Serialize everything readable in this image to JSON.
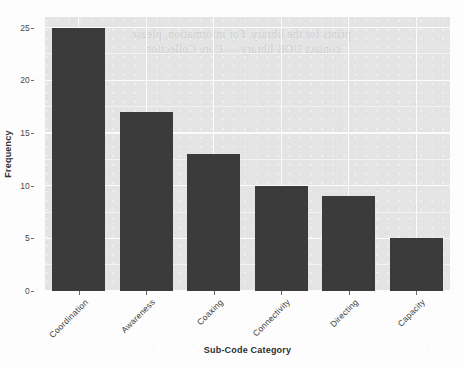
{
  "chart_data": {
    "type": "bar",
    "title": "",
    "xlabel": "Sub-Code Category",
    "ylabel": "Frequency",
    "categories": [
      "Coordination",
      "Awareness",
      "Coaxing",
      "Connectivity",
      "Directing",
      "Capacity"
    ],
    "values": [
      25,
      17,
      13,
      10,
      9,
      5
    ],
    "ylim": [
      0,
      26
    ],
    "yticks": [
      "0",
      "5",
      "10",
      "15",
      "20",
      "25"
    ],
    "ytick_values": [
      0,
      5,
      10,
      15,
      20,
      25
    ],
    "grid": "horizontal-and-vertical-white-on-gray-panel",
    "legend": "none",
    "bar_color": "#3b3b3b",
    "panel_color": "#e4e4e4",
    "gridline_color": "#fbfbfb"
  },
  "scan_artifacts": {
    "bleed_line_1": "prints for the library. For information, please",
    "bleed_line_2": "contact UOB library — Core Collection"
  }
}
